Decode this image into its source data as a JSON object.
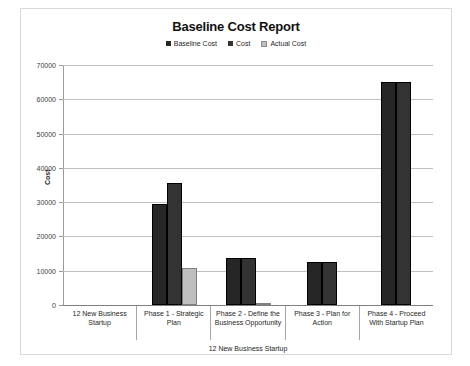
{
  "chart_data": {
    "type": "bar",
    "title": "Baseline Cost Report",
    "xlabel": "12 New Business Startup",
    "ylabel": "Cost",
    "ylim": [
      0,
      70000
    ],
    "ytick_labels": [
      "70000",
      "60000",
      "50000",
      "40000",
      "30000",
      "20000",
      "10000",
      "0"
    ],
    "ytick_values": [
      70000,
      60000,
      50000,
      40000,
      30000,
      20000,
      10000,
      0
    ],
    "grid": true,
    "legend_position": "top-center",
    "categories": [
      "12 New Business Startup",
      "Phase 1 - Strategic Plan",
      "Phase 2 - Define the Business Opportunity",
      "Phase 3 - Plan for Action",
      "Phase 4 - Proceed With Startup Plan"
    ],
    "series": [
      {
        "name": "Baseline Cost",
        "color": "#262626",
        "values": [
          0,
          29600,
          13800,
          12500,
          65100
        ]
      },
      {
        "name": "Cost",
        "color": "#333333",
        "values": [
          0,
          35600,
          13800,
          12500,
          65100
        ]
      },
      {
        "name": "Actual Cost",
        "color": "#bfbfbf",
        "values": [
          0,
          10700,
          500,
          0,
          0
        ]
      }
    ]
  },
  "legend": [
    {
      "label": "Baseline Cost",
      "color": "#262626"
    },
    {
      "label": "Cost",
      "color": "#333333"
    },
    {
      "label": "Actual Cost",
      "color": "#bfbfbf"
    }
  ]
}
